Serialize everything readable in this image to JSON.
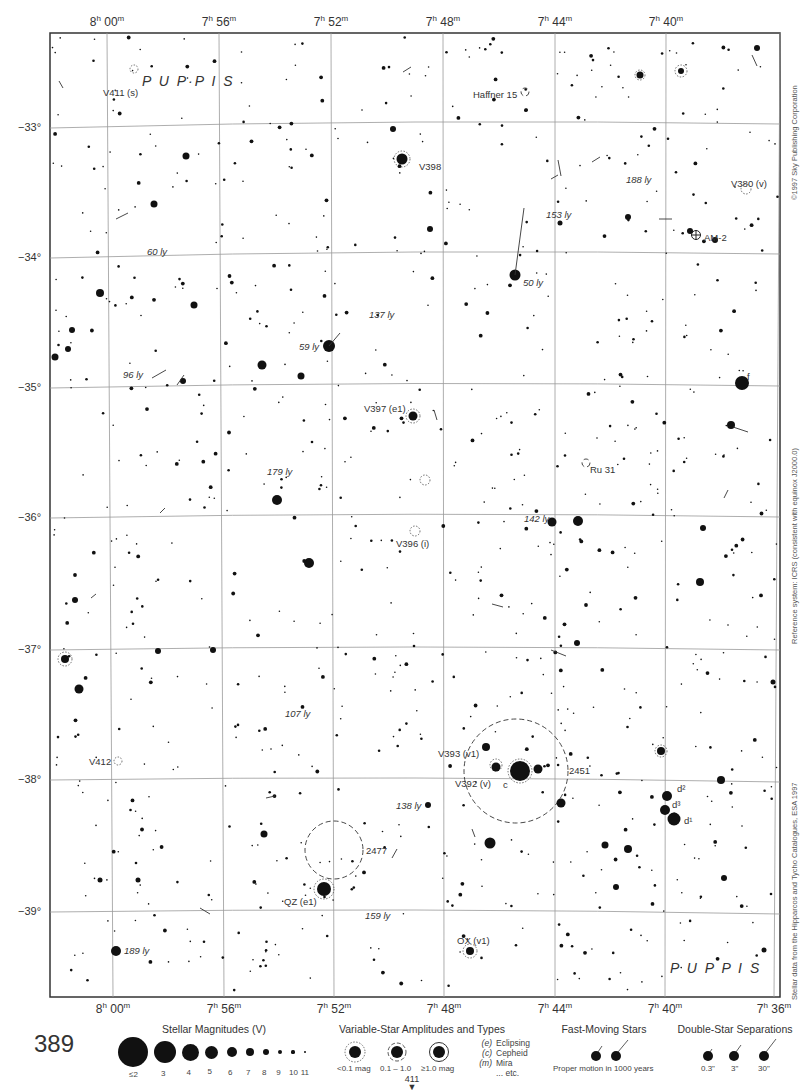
{
  "chart": {
    "constellation": "PUPPIS",
    "page_number": "389",
    "next_page_ref": "411",
    "copyright": "©1997 Sky Publishing Corporation",
    "reference_note": "Reference system: ICRS (consistent with equinox J2000.0)",
    "data_source": "Stellar data from the Hipparcos and Tycho Catalogues, ESA 1997"
  },
  "axes": {
    "ra_top": [
      {
        "h": "8",
        "m": "00",
        "x": 107
      },
      {
        "h": "7",
        "m": "56",
        "x": 219
      },
      {
        "h": "7",
        "m": "52",
        "x": 331
      },
      {
        "h": "7",
        "m": "48",
        "x": 443
      },
      {
        "h": "7",
        "m": "44",
        "x": 555
      },
      {
        "h": "7",
        "m": "40",
        "x": 666
      }
    ],
    "ra_bottom": [
      {
        "h": "8",
        "m": "00",
        "x": 113
      },
      {
        "h": "7",
        "m": "56",
        "x": 224
      },
      {
        "h": "7",
        "m": "52",
        "x": 334
      },
      {
        "h": "7",
        "m": "48",
        "x": 444
      },
      {
        "h": "7",
        "m": "44",
        "x": 555
      },
      {
        "h": "7",
        "m": "40",
        "x": 665
      },
      {
        "h": "7",
        "m": "36",
        "x": 774
      }
    ],
    "dec": [
      {
        "label": "−33°",
        "y": 128
      },
      {
        "label": "−34°",
        "y": 258
      },
      {
        "label": "−35°",
        "y": 388
      },
      {
        "label": "−36°",
        "y": 518
      },
      {
        "label": "−37°",
        "y": 650
      },
      {
        "label": "−38°",
        "y": 780
      },
      {
        "label": "−39°",
        "y": 912
      }
    ]
  },
  "labels": [
    {
      "text": "V411 (s)",
      "x": 103,
      "y": 94,
      "italic_part": "(s)"
    },
    {
      "text": "P U P·P I S",
      "x": 142,
      "y": 80,
      "kind": "constellation"
    },
    {
      "text": "Haffner 15",
      "x": 473,
      "y": 96
    },
    {
      "text": "V398",
      "x": 419,
      "y": 168
    },
    {
      "text": "188 ly",
      "x": 626,
      "y": 181,
      "kind": "distance"
    },
    {
      "text": "V380 (v)",
      "x": 731,
      "y": 185
    },
    {
      "text": "153 ly",
      "x": 546,
      "y": 216,
      "kind": "distance"
    },
    {
      "text": "AM-2",
      "x": 704,
      "y": 239
    },
    {
      "text": "60 ly",
      "x": 147,
      "y": 253,
      "kind": "distance"
    },
    {
      "text": "50 ly",
      "x": 523,
      "y": 284,
      "kind": "distance"
    },
    {
      "text": "137 ly",
      "x": 369,
      "y": 316,
      "kind": "distance"
    },
    {
      "text": "59 ly",
      "x": 299,
      "y": 348,
      "kind": "distance"
    },
    {
      "text": "96 ly",
      "x": 123,
      "y": 376,
      "kind": "distance"
    },
    {
      "text": "f",
      "x": 747,
      "y": 378
    },
    {
      "text": "V397 (e1)",
      "x": 364,
      "y": 410
    },
    {
      "text": "179 ly",
      "x": 267,
      "y": 473,
      "kind": "distance"
    },
    {
      "text": "Ru 31",
      "x": 590,
      "y": 471
    },
    {
      "text": "142 ly",
      "x": 524,
      "y": 520,
      "kind": "distance"
    },
    {
      "text": "V396 (i)",
      "x": 396,
      "y": 545
    },
    {
      "text": "107 ly",
      "x": 285,
      "y": 715,
      "kind": "distance"
    },
    {
      "text": "V393 (v1)",
      "x": 438,
      "y": 755
    },
    {
      "text": "V412",
      "x": 89,
      "y": 763
    },
    {
      "text": "2451",
      "x": 569,
      "y": 772
    },
    {
      "text": "V392 (v)",
      "x": 455,
      "y": 785
    },
    {
      "text": "c",
      "x": 503,
      "y": 786
    },
    {
      "text": "138 ly",
      "x": 396,
      "y": 807,
      "kind": "distance"
    },
    {
      "text": "d²",
      "x": 677,
      "y": 790
    },
    {
      "text": "d³",
      "x": 672,
      "y": 806
    },
    {
      "text": "d¹",
      "x": 684,
      "y": 822
    },
    {
      "text": "2477",
      "x": 366,
      "y": 852
    },
    {
      "text": "QZ (e1)",
      "x": 284,
      "y": 903
    },
    {
      "text": "159 ly",
      "x": 365,
      "y": 917,
      "kind": "distance"
    },
    {
      "text": "OX (v1)",
      "x": 457,
      "y": 942
    },
    {
      "text": "189 ly",
      "x": 124,
      "y": 952,
      "kind": "distance"
    },
    {
      "text": "P U P P I S",
      "x": 670,
      "y": 967,
      "kind": "constellation"
    }
  ],
  "legend": {
    "magnitudes": {
      "title": "Stellar Magnitudes (V)",
      "items": [
        {
          "label": "≤2",
          "r": 15
        },
        {
          "label": "3",
          "r": 11
        },
        {
          "label": "4",
          "r": 8.5
        },
        {
          "label": "5",
          "r": 6.5
        },
        {
          "label": "6",
          "r": 5
        },
        {
          "label": "7",
          "r": 4
        },
        {
          "label": "8",
          "r": 3
        },
        {
          "label": "9",
          "r": 2.2
        },
        {
          "label": "10",
          "r": 1.6
        },
        {
          "label": "11",
          "r": 1.1
        }
      ]
    },
    "variables": {
      "title": "Variable-Star Amplitudes and Types",
      "amplitudes": [
        "<0.1 mag",
        "0.1 – 1.0",
        "≥1.0 mag"
      ],
      "types": [
        {
          "code": "(e)",
          "name": "Eclipsing"
        },
        {
          "code": "(c)",
          "name": "Cepheid"
        },
        {
          "code": "(m)",
          "name": "Mira"
        },
        {
          "code": "",
          "name": "... etc."
        }
      ]
    },
    "fast_moving": {
      "title": "Fast-Moving Stars",
      "caption": "Proper motion in 1000 years"
    },
    "doubles": {
      "title": "Double-Star Separations",
      "items": [
        "0.3\"",
        "3\"",
        "30\""
      ]
    }
  },
  "colors": {
    "ink": "#111111",
    "grid": "#999999",
    "frame": "#333333",
    "paper": "#ffffff"
  }
}
